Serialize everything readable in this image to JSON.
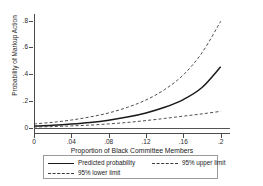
{
  "chart_data": {
    "type": "line",
    "title": "",
    "xlabel": "Proportion of Black Committee Members",
    "ylabel": "Probability of Markup Action",
    "xlim": [
      0,
      0.21
    ],
    "ylim": [
      -0.04,
      0.85
    ],
    "grid": false,
    "legend_position": "bottom",
    "xticks": [
      "0",
      ".04",
      ".08",
      ".12",
      ".16",
      ".2"
    ],
    "xtick_values": [
      0,
      0.04,
      0.08,
      0.12,
      0.16,
      0.2
    ],
    "yticks": [
      "0",
      ".2",
      ".4",
      ".6",
      ".8"
    ],
    "ytick_values": [
      0,
      0.2,
      0.4,
      0.6,
      0.8
    ],
    "x": [
      0,
      0.02,
      0.04,
      0.06,
      0.08,
      0.1,
      0.12,
      0.14,
      0.16,
      0.18,
      0.2
    ],
    "series": [
      {
        "name": "Predicted probability",
        "style": "solid",
        "color": "#1a1a1a",
        "values": [
          0.012,
          0.018,
          0.027,
          0.039,
          0.056,
          0.079,
          0.11,
          0.152,
          0.21,
          0.3,
          0.455
        ]
      },
      {
        "name": "95% upper limit",
        "style": "dashed",
        "color": "#3a3a3a",
        "values": [
          0.028,
          0.04,
          0.057,
          0.08,
          0.11,
          0.152,
          0.207,
          0.285,
          0.395,
          0.56,
          0.795
        ]
      },
      {
        "name": "95% lower limit",
        "style": "dashed",
        "color": "#3a3a3a",
        "values": [
          0.005,
          0.008,
          0.013,
          0.019,
          0.028,
          0.039,
          0.053,
          0.069,
          0.086,
          0.103,
          0.122
        ]
      }
    ],
    "reference_line_y": 0
  },
  "axes": {
    "x_title": "Proportion of Black Committee Members",
    "y_title": "Probability of Markup Action",
    "x_tick_labels": [
      "0",
      ".04",
      ".08",
      ".12",
      ".16",
      ".2"
    ],
    "y_tick_labels": [
      "0",
      ".2",
      ".4",
      ".6",
      ".8"
    ]
  },
  "legend": {
    "items": [
      {
        "label": "Predicted probability",
        "style": "solid"
      },
      {
        "label": "95% upper limit",
        "style": "dashed"
      },
      {
        "label": "95% lower limit",
        "style": "dashed"
      }
    ]
  }
}
